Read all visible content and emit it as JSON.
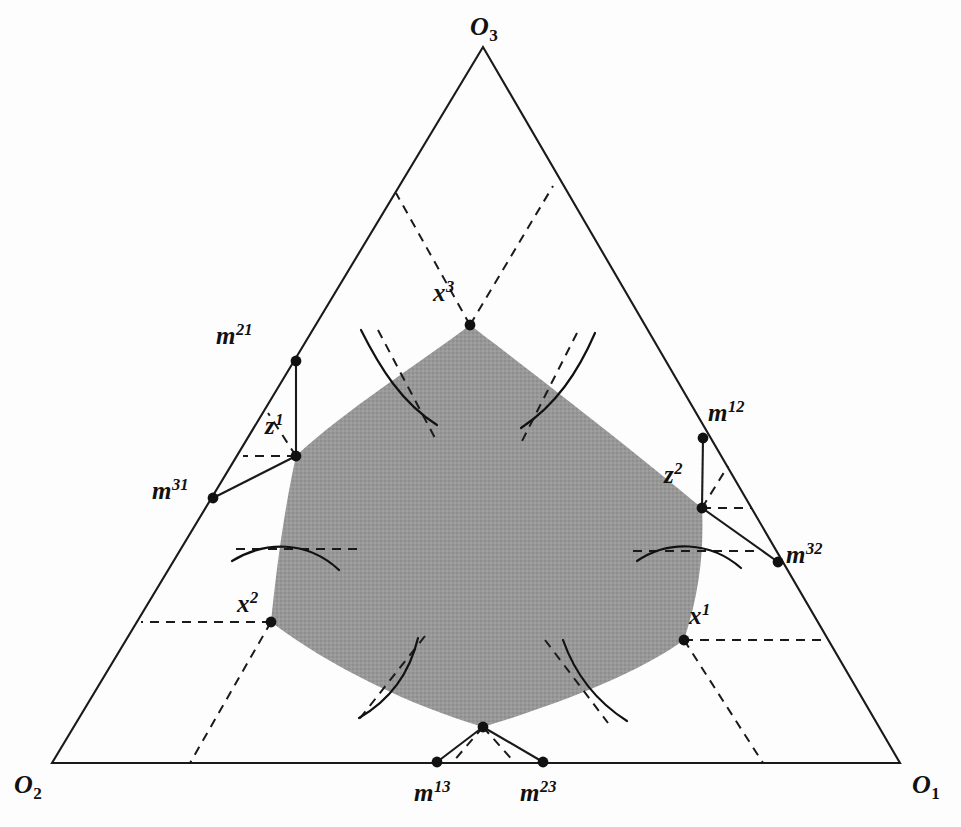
{
  "figure": {
    "kind": "geometric-diagram",
    "background_color": "#fdfdfd",
    "line_color": "#1a1a1a",
    "shade_color": "#969696",
    "shade_opacity": 1,
    "width": 961,
    "height": 827
  },
  "triangle": {
    "vertices": [
      {
        "name": "O3",
        "x": 483,
        "y": 47
      },
      {
        "name": "O2",
        "x": 52,
        "y": 763
      },
      {
        "name": "O1",
        "x": 900,
        "y": 763
      }
    ]
  },
  "corner_labels": [
    {
      "id": "O3",
      "base": "O",
      "sub": "3",
      "x": 470,
      "y": 14
    },
    {
      "id": "O2",
      "base": "O",
      "sub": "2",
      "x": 14,
      "y": 772
    },
    {
      "id": "O1",
      "base": "O",
      "sub": "1",
      "x": 912,
      "y": 772
    }
  ],
  "point_labels": [
    {
      "id": "x3",
      "base": "x",
      "sup": "3",
      "x": 433,
      "y": 280
    },
    {
      "id": "x2",
      "base": "x",
      "sup": "2",
      "x": 237,
      "y": 591
    },
    {
      "id": "x1",
      "base": "x",
      "sup": "1",
      "x": 689,
      "y": 603
    },
    {
      "id": "z1",
      "base": "z",
      "sup": "1",
      "x": 265,
      "y": 413
    },
    {
      "id": "z2",
      "base": "z",
      "sup": "2",
      "x": 664,
      "y": 462
    },
    {
      "id": "m21",
      "base": "m",
      "sup": "21",
      "x": 216,
      "y": 323
    },
    {
      "id": "m31",
      "base": "m",
      "sup": "31",
      "x": 152,
      "y": 478
    },
    {
      "id": "m12",
      "base": "m",
      "sup": "12",
      "x": 708,
      "y": 400
    },
    {
      "id": "m32",
      "base": "m",
      "sup": "32",
      "x": 786,
      "y": 542
    },
    {
      "id": "m13",
      "base": "m",
      "sup": "13",
      "x": 414,
      "y": 780
    },
    {
      "id": "m23",
      "base": "m",
      "sup": "23",
      "x": 520,
      "y": 780
    }
  ],
  "points": [
    {
      "id": "x3",
      "x": 470,
      "y": 325
    },
    {
      "id": "z1",
      "x": 296,
      "y": 456
    },
    {
      "id": "x2",
      "x": 271,
      "y": 622
    },
    {
      "id": "z3",
      "x": 483,
      "y": 727
    },
    {
      "id": "x1",
      "x": 684,
      "y": 640
    },
    {
      "id": "z2",
      "x": 702,
      "y": 508
    },
    {
      "id": "m21",
      "x": 296,
      "y": 361
    },
    {
      "id": "m31",
      "x": 213,
      "y": 498
    },
    {
      "id": "m12",
      "x": 703,
      "y": 438
    },
    {
      "id": "m32",
      "x": 778,
      "y": 562
    },
    {
      "id": "m13",
      "x": 437,
      "y": 762
    },
    {
      "id": "m23",
      "x": 543,
      "y": 762
    }
  ],
  "core_region": {
    "label": "shaded core",
    "vertex_order": [
      "x3",
      "z1",
      "x2",
      "z3",
      "x1",
      "z2"
    ]
  }
}
